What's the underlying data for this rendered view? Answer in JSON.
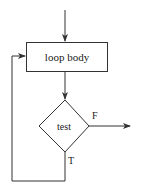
{
  "diagram": {
    "type": "flowchart",
    "title": "",
    "nodes": [
      {
        "id": "body",
        "shape": "rectangle",
        "label": "loop body"
      },
      {
        "id": "test",
        "shape": "diamond",
        "label": "test"
      }
    ],
    "edges": [
      {
        "from": "entry",
        "to": "body",
        "label": ""
      },
      {
        "from": "body",
        "to": "test",
        "label": ""
      },
      {
        "from": "test",
        "to": "exit",
        "label": "F"
      },
      {
        "from": "test",
        "to": "body",
        "label": "T"
      }
    ],
    "labels": {
      "body": "loop body",
      "test": "test",
      "false_branch": "F",
      "true_branch": "T"
    },
    "colors": {
      "stroke": "#333333",
      "text": "#222222",
      "background": "#ffffff"
    }
  }
}
